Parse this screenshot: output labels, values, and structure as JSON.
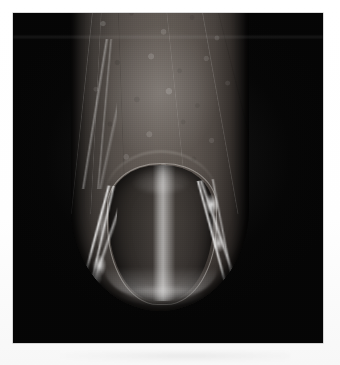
{
  "page": {
    "background_color": "#fdfdfd",
    "width": 340,
    "height": 365,
    "caption": ""
  },
  "photo": {
    "subject": "fingertip-with-nail",
    "description": "Grayscale macro photograph of a human fingertip showing the nail plate, proximal and lateral nail folds on a black background",
    "background_color": "#050505",
    "color_mode": "grayscale",
    "frame": {
      "left": 13,
      "top": 13,
      "width": 310,
      "height": 330
    }
  },
  "anatomy": {
    "finger": {
      "label": "finger-shaft",
      "skin_tone_hex": "#a09a95",
      "shadow_hex": "#2b2928",
      "tip_bottom_y": 311,
      "left_edge_x": 71,
      "right_edge_x": 249
    },
    "nail_plate": {
      "label": "nail-plate",
      "tone_hex": "#7d7874",
      "highlight_hex": "#ffffff",
      "cuticle_arc_y": 166,
      "free_edge_y": 288,
      "left_edge_x": 109,
      "right_edge_x": 213
    },
    "highlights": [
      {
        "label": "nail-central-specular-band"
      },
      {
        "label": "left-lateral-fold-glint"
      },
      {
        "label": "right-lateral-fold-glint"
      },
      {
        "label": "fingertip-pulp-highlight"
      }
    ],
    "textures": [
      {
        "label": "mottled-skin-texture"
      },
      {
        "label": "longitudinal-skin-creases"
      },
      {
        "label": "film-grain"
      }
    ]
  }
}
